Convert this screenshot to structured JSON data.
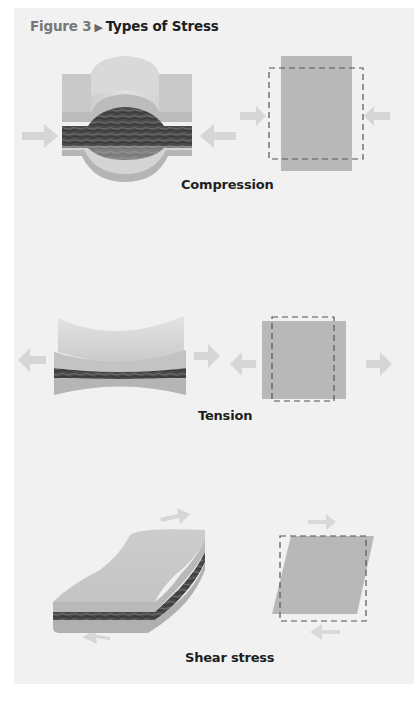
{
  "figure": {
    "number_label": "Figure 3",
    "separator_icon": "▶",
    "title": "Types of Stress"
  },
  "panels": [
    {
      "id": "compression",
      "label": "Compression",
      "description": "Rock block squeezed by opposing inward arrows; layers bulge upward and downward; square deformed into tall narrow rectangle"
    },
    {
      "id": "tension",
      "label": "Tension",
      "description": "Rock block pulled by outward arrows; layers thin in middle; square stretched into wide rectangle"
    },
    {
      "id": "shear",
      "label": "Shear stress",
      "description": "Layered slab with opposing parallel arrows; square skewed into parallelogram"
    }
  ],
  "colors": {
    "background": "#f1f1f1",
    "rock_light": "#cfcfcf",
    "rock_mid": "#b5b5b5",
    "rock_dark": "#4a4a4a",
    "square_fill": "#b8b8b8",
    "arrow": "#d8d8d8",
    "dash": "#555555",
    "label_text": "#1e1e1e",
    "figure_number": "#777777"
  }
}
